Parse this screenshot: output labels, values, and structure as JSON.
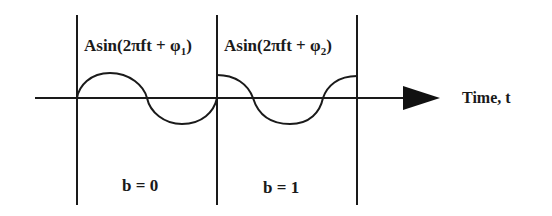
{
  "diagram": {
    "type": "bpsk-phase-shift-keying-waveform",
    "axis_label": "Time, t",
    "segments": [
      {
        "formula_prefix": "Asin(2πft + φ",
        "formula_sub": "1",
        "formula_suffix": ")",
        "bit_label": "b = 0"
      },
      {
        "formula_prefix": "Asin(2πft + φ",
        "formula_sub": "2",
        "formula_suffix": ")",
        "bit_label": "b = 1"
      }
    ],
    "colors": {
      "line": "#1a1a1a",
      "background": "#ffffff"
    }
  }
}
